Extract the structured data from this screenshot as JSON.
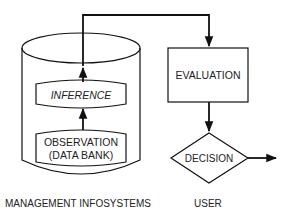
{
  "diagram": {
    "nodes": {
      "inference": {
        "label": "INFERENCE"
      },
      "observation": {
        "label_line1": "OBSERVATION",
        "label_line2": "(DATA BANK)"
      },
      "evaluation": {
        "label": "EVALUATION"
      },
      "decision": {
        "label": "DECISION"
      }
    },
    "captions": {
      "left": "MANAGEMENT INFOSYSTEMS",
      "right": "USER"
    },
    "colors": {
      "stroke": "#111111",
      "text": "#222222",
      "background": "#ffffff"
    }
  }
}
